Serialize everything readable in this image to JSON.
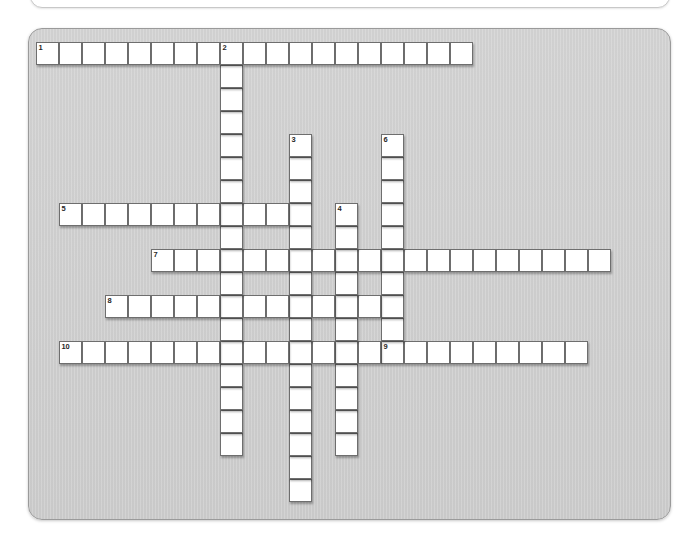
{
  "app": {
    "title": "Crossword Puzzle",
    "panel_background": "#cfcfcf",
    "cell_background": "#ffffff",
    "cell_border": "#6e6e6e",
    "number_color": "#272727"
  },
  "grid": {
    "cell_size": 23,
    "origin_x": 7,
    "origin_y": 13,
    "columns": 28,
    "rows": 21
  },
  "entries": [
    {
      "number": "1",
      "direction": "across",
      "col": 0,
      "row": 0,
      "length": 19,
      "answer": ""
    },
    {
      "number": "2",
      "direction": "down",
      "col": 8,
      "row": 0,
      "length": 18,
      "answer": ""
    },
    {
      "number": "3",
      "direction": "down",
      "col": 11,
      "row": 4,
      "length": 16,
      "answer": ""
    },
    {
      "number": "4",
      "direction": "down",
      "col": 13,
      "row": 7,
      "length": 11,
      "answer": ""
    },
    {
      "number": "5",
      "direction": "across",
      "col": 1,
      "row": 7,
      "length": 10,
      "answer": ""
    },
    {
      "number": "6",
      "direction": "down",
      "col": 15,
      "row": 4,
      "length": 10,
      "answer": ""
    },
    {
      "number": "7",
      "direction": "across",
      "col": 5,
      "row": 9,
      "length": 20,
      "answer": ""
    },
    {
      "number": "8",
      "direction": "across",
      "col": 3,
      "row": 11,
      "length": 12,
      "answer": ""
    },
    {
      "number": "9",
      "direction": "across",
      "col": 15,
      "row": 13,
      "length": 9,
      "answer": ""
    },
    {
      "number": "10",
      "direction": "across",
      "col": 1,
      "row": 13,
      "length": 14,
      "answer": ""
    }
  ]
}
